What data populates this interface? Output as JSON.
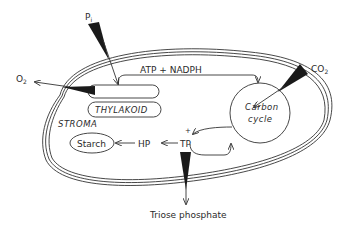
{
  "diagram": {
    "compartments": {
      "stroma_label": "STROMA",
      "thylakoid_label": "THYLAKOID"
    },
    "nodes": {
      "carbon_cycle_line1": "Carbon",
      "carbon_cycle_line2": "cycle",
      "starch": "Starch",
      "hp": "HP",
      "tp": "TP",
      "energy_label": "ATP + NADPH",
      "tp_plus_mark": "+"
    },
    "inputs_outputs": {
      "pi_main": "P",
      "pi_sub": "i",
      "o2_main": "O",
      "o2_sub": "2",
      "co2_main": "CO",
      "co2_sub": "2",
      "triose_phosphate": "Triose phosphate"
    },
    "flows": [
      {
        "from": "Pi",
        "to": "thylakoid",
        "type": "import"
      },
      {
        "from": "thylakoid",
        "to": "O2",
        "type": "export"
      },
      {
        "from": "thylakoid",
        "to": "Carbon cycle",
        "label": "ATP + NADPH"
      },
      {
        "from": "CO2",
        "to": "Carbon cycle",
        "type": "import"
      },
      {
        "from": "Carbon cycle",
        "to": "TP"
      },
      {
        "from": "TP",
        "to": "Carbon cycle"
      },
      {
        "from": "TP",
        "to": "HP"
      },
      {
        "from": "HP",
        "to": "Starch"
      },
      {
        "from": "TP",
        "to": "Triose phosphate",
        "type": "export"
      }
    ],
    "colors": {
      "ink": "#1a1a1a",
      "background": "#ffffff"
    }
  }
}
